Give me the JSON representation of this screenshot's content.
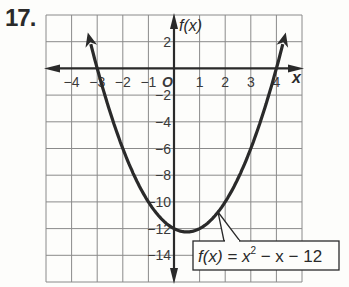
{
  "problem_number": "17.",
  "chart_data": {
    "type": "line",
    "title": "",
    "function_label": "f(x) = x² − x − 12",
    "equation": {
      "lhs": "f(x)",
      "rhs_base": "x",
      "rhs_exp": "2",
      "rhs_rest": "− x − 12"
    },
    "xlabel": "x",
    "ylabel": "f(x)",
    "xlim": [
      -5,
      5
    ],
    "ylim": [
      -16,
      4
    ],
    "grid": true,
    "x_ticks": [
      -4,
      -3,
      -2,
      -1,
      1,
      2,
      3,
      4
    ],
    "y_ticks": [
      2,
      -2,
      -4,
      -6,
      -8,
      -10,
      -12,
      -14
    ],
    "origin_label": "O",
    "series": [
      {
        "name": "f(x) = x^2 - x - 12",
        "x": [
          -3.4,
          -3,
          -2,
          -1,
          0,
          0.5,
          1,
          2,
          3,
          4,
          4.4
        ],
        "y": [
          3.0,
          0,
          -6,
          -10,
          -12,
          -12.25,
          -12,
          -10,
          -6,
          0,
          3.0
        ]
      }
    ],
    "vertex": [
      0.5,
      -12.25
    ],
    "roots": [
      -3,
      4
    ]
  }
}
